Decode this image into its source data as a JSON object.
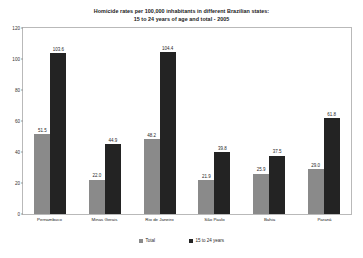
{
  "chart_data": {
    "type": "bar",
    "title": "Homicide rates per 100,000  inhabitants in different Brazilian states: 15 to 24 years of age and total - 2005",
    "title_lines": [
      "Homicide rates per 100,000  inhabitants in different Brazilian states:",
      "15 to 24 years of age and total - 2005"
    ],
    "categories": [
      "Pernambuco",
      "Minas Gerais",
      "Rio de Janeiro",
      "São Paulo",
      "Bahia",
      "Paraná"
    ],
    "series": [
      {
        "name": "Total",
        "color": "#8a8a8a",
        "values": [
          51.5,
          22.0,
          48.2,
          21.9,
          25.9,
          29.0
        ]
      },
      {
        "name": "15 to 24 years",
        "color": "#232323",
        "values": [
          103.6,
          44.9,
          104.4,
          39.8,
          37.5,
          61.8
        ]
      }
    ],
    "xlabel": "",
    "ylabel": "",
    "ylim": [
      0,
      120
    ],
    "yticks": [
      0,
      20,
      40,
      60,
      80,
      100,
      120
    ],
    "grid": false,
    "legend_position": "bottom",
    "data_labels": true
  }
}
